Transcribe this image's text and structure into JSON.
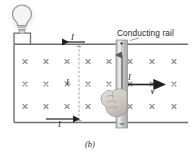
{
  "figure": {
    "caption": "(b)",
    "labels": {
      "conducting_rail": "Conducting rail",
      "current_top": "I",
      "current_bottom": "I",
      "current_rod": "I",
      "length": "L",
      "velocity": "v"
    },
    "colors": {
      "line": "#6f6f6f",
      "text": "#231f20",
      "arrow": "#231f20",
      "field_mark": "#8c8c8c",
      "rod_fill": "#c9c9c9",
      "hand_fill": "#d9d4cf",
      "bulb_glow": "#efefef"
    },
    "field": {
      "symbol": "x",
      "direction": "into-page",
      "rows": 3,
      "columns": 8,
      "count": 24
    },
    "elements": [
      "light-bulb",
      "top-rail",
      "bottom-rail",
      "left-wire",
      "sliding-rod",
      "hand",
      "velocity-arrow",
      "length-dimension-line"
    ]
  }
}
